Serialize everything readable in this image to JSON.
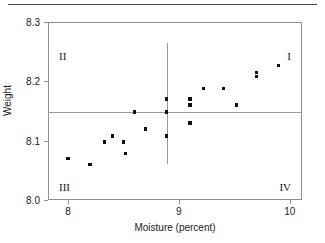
{
  "figure": {
    "top_rule": true,
    "clipped_caption": ""
  },
  "chart_data": {
    "type": "scatter",
    "title": "",
    "xlabel": "Moisture (percent)",
    "ylabel": "Weight",
    "xlim": [
      7.82,
      10.11
    ],
    "ylim": [
      8.0,
      8.3
    ],
    "xticks": [
      8,
      9,
      10
    ],
    "xtick_labels": [
      "8",
      "9",
      "10"
    ],
    "yticks": [
      8.0,
      8.1,
      8.2,
      8.3
    ],
    "ytick_labels": [
      "8.0",
      "8.1",
      "8.2",
      "8.3"
    ],
    "grid": false,
    "legend": null,
    "reference_lines": {
      "vertical_x": 8.89,
      "horizontal_y": 8.148,
      "vertical_extent_y": [
        8.06,
        8.265
      ],
      "horizontal_extent_x": [
        7.82,
        10.11
      ]
    },
    "quadrant_labels": {
      "I": "I",
      "II": "II",
      "III": "III",
      "IV": "IV"
    },
    "x": [
      8.0,
      8.2,
      8.33,
      8.4,
      8.5,
      8.52,
      8.6,
      8.7,
      8.89,
      8.89,
      8.89,
      9.1,
      9.1,
      9.1,
      9.22,
      9.4,
      9.52,
      9.7,
      9.7,
      9.9
    ],
    "y": [
      8.07,
      8.06,
      8.098,
      8.108,
      8.098,
      8.078,
      8.148,
      8.12,
      8.17,
      8.148,
      8.108,
      8.17,
      8.16,
      8.13,
      8.188,
      8.188,
      8.16,
      8.215,
      8.208,
      8.227
    ],
    "points": [
      {
        "x": 8.0,
        "y": 8.07
      },
      {
        "x": 8.2,
        "y": 8.06
      },
      {
        "x": 8.33,
        "y": 8.098
      },
      {
        "x": 8.4,
        "y": 8.108
      },
      {
        "x": 8.5,
        "y": 8.098
      },
      {
        "x": 8.52,
        "y": 8.078
      },
      {
        "x": 8.6,
        "y": 8.148
      },
      {
        "x": 8.7,
        "y": 8.12
      },
      {
        "x": 8.89,
        "y": 8.17
      },
      {
        "x": 8.89,
        "y": 8.148
      },
      {
        "x": 8.89,
        "y": 8.108
      },
      {
        "x": 9.1,
        "y": 8.17
      },
      {
        "x": 9.1,
        "y": 8.16
      },
      {
        "x": 9.1,
        "y": 8.13
      },
      {
        "x": 9.22,
        "y": 8.188
      },
      {
        "x": 9.4,
        "y": 8.188
      },
      {
        "x": 9.52,
        "y": 8.16
      },
      {
        "x": 9.7,
        "y": 8.215
      },
      {
        "x": 9.7,
        "y": 8.208
      },
      {
        "x": 9.9,
        "y": 8.227
      }
    ],
    "marker_color": "#111111",
    "axis_color": "#8f8f8f",
    "reference_line_color": "#9a9a9a"
  }
}
